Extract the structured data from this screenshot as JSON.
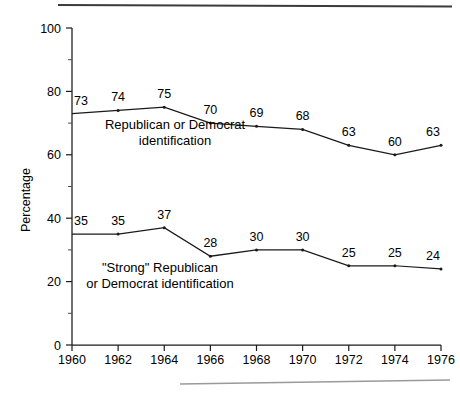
{
  "figure": {
    "background_color": "#ffffff",
    "ink_color": "#1a1a1a",
    "top_rule_color": "#3b3b3b",
    "bottom_rule_color": "#9a9a9a"
  },
  "chart_data": {
    "type": "line",
    "title": "",
    "subtitle": "",
    "xlabel": "",
    "ylabel": "Percentage",
    "xlim": [
      1960,
      1976
    ],
    "ylim": [
      0,
      100
    ],
    "grid": false,
    "legend_position": "inline-annotation",
    "x": [
      1960,
      1962,
      1964,
      1966,
      1968,
      1970,
      1972,
      1974,
      1976
    ],
    "x_tick_labels": [
      "1960",
      "1962",
      "1964",
      "1966",
      "1968",
      "1970",
      "1972",
      "1974",
      "1976"
    ],
    "y_tick_labels": [
      "0",
      "20",
      "40",
      "60",
      "80",
      "100"
    ],
    "y_ticks_major": [
      0,
      20,
      40,
      60,
      80,
      100
    ],
    "y_ticks_minor": [
      10,
      30,
      50,
      70,
      90
    ],
    "series": [
      {
        "name": "Republican or Democrat identification",
        "annotation_line1": "Republican or Democrat",
        "annotation_line2": "identification",
        "values": [
          73,
          74,
          75,
          70,
          69,
          68,
          63,
          60,
          63
        ],
        "point_labels": [
          "73",
          "74",
          "75",
          "70",
          "69",
          "68",
          "63",
          "60",
          "63"
        ]
      },
      {
        "name": "\"Strong\" Republican or Democrat identification",
        "annotation_line1": "\"Strong\" Republican",
        "annotation_line2": "or Democrat identification",
        "values": [
          35,
          35,
          37,
          28,
          30,
          30,
          25,
          25,
          24
        ],
        "point_labels": [
          "35",
          "35",
          "37",
          "28",
          "30",
          "30",
          "25",
          "25",
          "24"
        ]
      }
    ]
  }
}
